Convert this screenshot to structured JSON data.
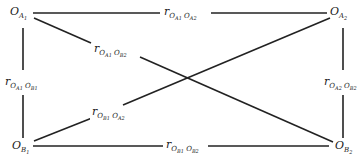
{
  "diagram": {
    "nodes": [
      {
        "id": "OA1",
        "base": "O",
        "sub": "A",
        "subsub": "1",
        "position": "top-left"
      },
      {
        "id": "OA2",
        "base": "O",
        "sub": "A",
        "subsub": "2",
        "position": "top-right"
      },
      {
        "id": "OB1",
        "base": "O",
        "sub": "B",
        "subsub": "1",
        "position": "bottom-left"
      },
      {
        "id": "OB2",
        "base": "O",
        "sub": "B",
        "subsub": "2",
        "position": "bottom-right"
      }
    ],
    "edges": [
      {
        "from": "OA1",
        "to": "OA2",
        "label": {
          "r": "r",
          "s1": "O",
          "s1a": "A",
          "s1b": "1",
          "s2": "O",
          "s2a": "A",
          "s2b": "2"
        }
      },
      {
        "from": "OA1",
        "to": "OB1",
        "label": {
          "r": "r",
          "s1": "O",
          "s1a": "A",
          "s1b": "1",
          "s2": "O",
          "s2a": "B",
          "s2b": "1"
        }
      },
      {
        "from": "OA2",
        "to": "OB2",
        "label": {
          "r": "r",
          "s1": "O",
          "s1a": "A",
          "s1b": "2",
          "s2": "O",
          "s2a": "B",
          "s2b": "2"
        }
      },
      {
        "from": "OB1",
        "to": "OB2",
        "label": {
          "r": "r",
          "s1": "O",
          "s1a": "B",
          "s1b": "1",
          "s2": "O",
          "s2a": "B",
          "s2b": "2"
        }
      },
      {
        "from": "OA1",
        "to": "OB2",
        "label": {
          "r": "r",
          "s1": "O",
          "s1a": "A",
          "s1b": "1",
          "s2": "O",
          "s2a": "B",
          "s2b": "2"
        }
      },
      {
        "from": "OB1",
        "to": "OA2",
        "label": {
          "r": "r",
          "s1": "O",
          "s1a": "B",
          "s1b": "1",
          "s2": "O",
          "s2a": "A",
          "s2b": "2"
        }
      }
    ],
    "line_color": "#222222"
  }
}
